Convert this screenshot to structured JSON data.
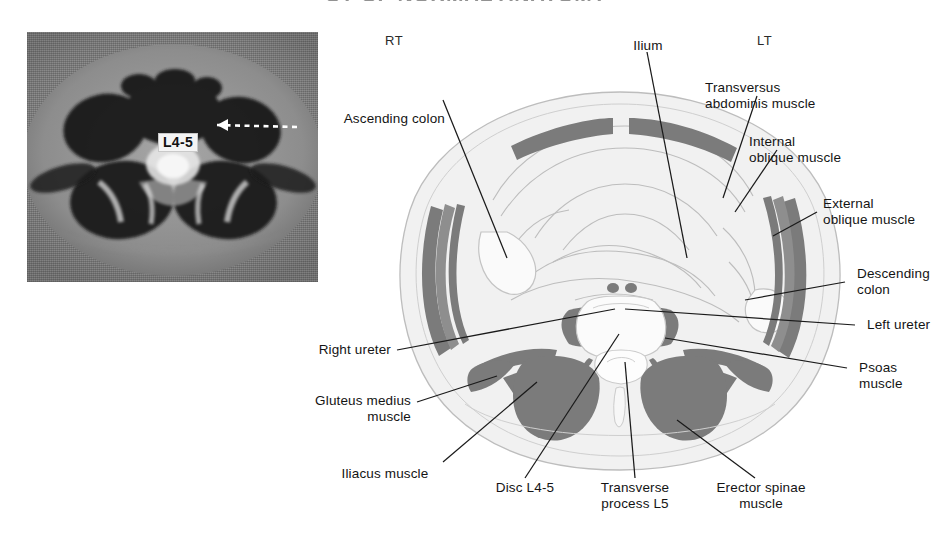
{
  "figure": {
    "title": "CT OF NORMAL ANATOMY",
    "type": "axial-cross-section-anatomy-diagram"
  },
  "mri": {
    "modality_label": "L4-5",
    "caption": "axial MRI of lumbar spine at L4-5 level",
    "arrow": "dashed-arrow-pointing-left"
  },
  "orientation": {
    "right_marker": "RT",
    "left_marker": "LT"
  },
  "labels": [
    {
      "id": "ascending-colon",
      "text": "Ascending colon",
      "align": "right"
    },
    {
      "id": "ilium",
      "text": "Ilium",
      "align": "center"
    },
    {
      "id": "transversus-abdominis",
      "text": "Transversus\nabdominis muscle",
      "align": "left"
    },
    {
      "id": "internal-oblique",
      "text": "Internal\noblique muscle",
      "align": "left"
    },
    {
      "id": "external-oblique",
      "text": "External\noblique muscle",
      "align": "left"
    },
    {
      "id": "descending-colon",
      "text": "Descending\ncolon",
      "align": "left"
    },
    {
      "id": "left-ureter",
      "text": "Left ureter",
      "align": "left"
    },
    {
      "id": "psoas-muscle",
      "text": "Psoas\nmuscle",
      "align": "left"
    },
    {
      "id": "erector-spinae",
      "text": "Erector spinae\nmuscle",
      "align": "center"
    },
    {
      "id": "transverse-process-l5",
      "text": "Transverse\nprocess L5",
      "align": "center"
    },
    {
      "id": "disc-l4-5",
      "text": "Disc L4-5",
      "align": "center"
    },
    {
      "id": "iliacus-muscle",
      "text": "Iliacus muscle",
      "align": "center"
    },
    {
      "id": "gluteus-medius",
      "text": "Gluteus medius\nmuscle",
      "align": "right"
    },
    {
      "id": "right-ureter",
      "text": "Right ureter",
      "align": "right"
    }
  ],
  "colors": {
    "muscle_fill": "#7b7b7b",
    "body_fill": "#f1f1f1",
    "outline": "#b9b9b9",
    "leader_line": "#1a1a1a",
    "bone_fill": "#fbfbfb",
    "text": "#141414",
    "mri_background": "#8e8e8e"
  }
}
